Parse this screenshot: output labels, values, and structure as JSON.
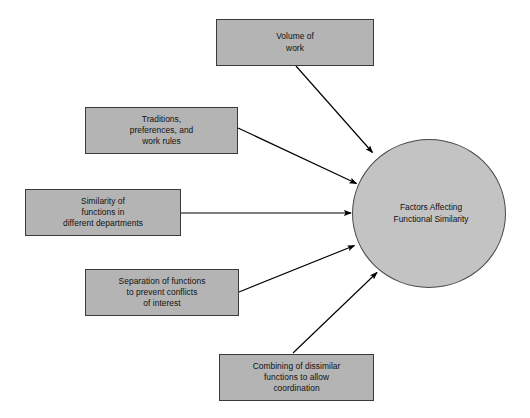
{
  "diagram": {
    "type": "influence-diagram",
    "background_color": "#ffffff",
    "box_fill_color": "#b4b4b4",
    "box_border_color": "#3a3a3a",
    "circle_fill_color": "#c3c3c3",
    "circle_border_color": "#4a4a4a",
    "text_color": "#111111",
    "arrow_color": "#000000",
    "center": {
      "label": "Factors Affecting\nFunctional Similarity",
      "shape": "circle"
    },
    "factors": [
      {
        "id": "volume-of-work",
        "label": "Volume of\nwork",
        "shape": "rectangle"
      },
      {
        "id": "traditions-preferences-work-rules",
        "label": "Traditions,\npreferences, and\nwork rules",
        "shape": "rectangle"
      },
      {
        "id": "similarity-of-functions",
        "label": "Similarity of\nfunctions in\ndifferent departments",
        "shape": "rectangle"
      },
      {
        "id": "separation-of-functions",
        "label": "Separation of functions\nto prevent conflicts\nof interest",
        "shape": "rectangle"
      },
      {
        "id": "combining-of-dissimilar-functions",
        "label": "Combining of dissimilar\nfunctions to allow\ncoordination",
        "shape": "rectangle"
      }
    ],
    "connections": [
      {
        "from": "volume-of-work",
        "to": "center",
        "style": "arrow"
      },
      {
        "from": "traditions-preferences-work-rules",
        "to": "center",
        "style": "arrow"
      },
      {
        "from": "similarity-of-functions",
        "to": "center",
        "style": "arrow"
      },
      {
        "from": "separation-of-functions",
        "to": "center",
        "style": "arrow"
      },
      {
        "from": "combining-of-dissimilar-functions",
        "to": "center",
        "style": "arrow"
      }
    ]
  }
}
